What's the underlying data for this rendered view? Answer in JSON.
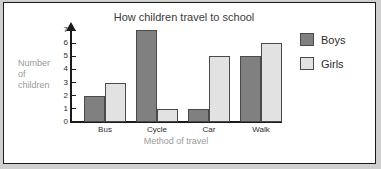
{
  "frame": {
    "border_color": "#1a1a1a",
    "background": "#ffffff"
  },
  "chart_data": {
    "type": "bar",
    "title": "How children travel to school",
    "xlabel": "Method of travel",
    "ylabel": "Number of children",
    "ylabel_lines": [
      "Number",
      "of",
      "children"
    ],
    "categories": [
      "Bus",
      "Cycle",
      "Car",
      "Walk"
    ],
    "series": [
      {
        "name": "Boys",
        "color": "#808080",
        "values": [
          2,
          7,
          1,
          5
        ]
      },
      {
        "name": "Girls",
        "color": "#e2e2e2",
        "values": [
          3,
          1,
          5,
          6
        ]
      }
    ],
    "ylim": [
      0,
      7
    ],
    "yticks": [
      0,
      1,
      2,
      3,
      4,
      5,
      6,
      7
    ],
    "ytick_labels": [
      "0",
      "1",
      "2",
      "3",
      "4",
      "5",
      "6",
      "7"
    ],
    "grid": false,
    "legend_position": "right",
    "y_axis_arrow": true
  },
  "legend": {
    "entries": [
      {
        "label": "Boys",
        "color": "#808080"
      },
      {
        "label": "Girls",
        "color": "#e2e2e2"
      }
    ]
  }
}
